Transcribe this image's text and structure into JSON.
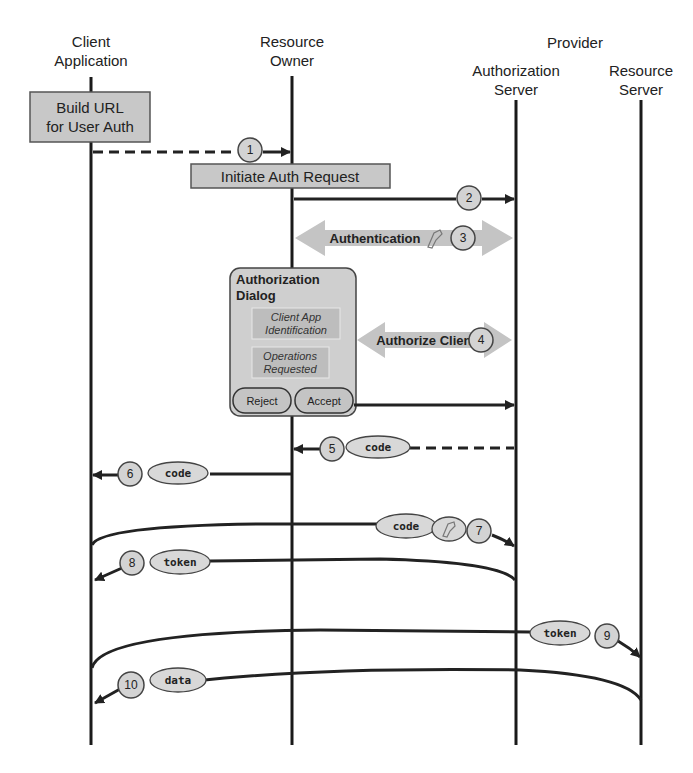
{
  "diagram": {
    "type": "sequence",
    "group_label": "Provider",
    "participants": [
      {
        "id": "client",
        "line1": "Client",
        "line2": "Application"
      },
      {
        "id": "owner",
        "line1": "Resource",
        "line2": "Owner"
      },
      {
        "id": "authserver",
        "line1": "Authorization",
        "line2": "Server"
      },
      {
        "id": "resserver",
        "line1": "Resource",
        "line2": "Server"
      }
    ],
    "activities": {
      "build_url": {
        "line1": "Build URL",
        "line2": "for User Auth"
      },
      "initiate": {
        "label": "Initiate Auth Request"
      }
    },
    "dialog": {
      "title1": "Authorization",
      "title2": "Dialog",
      "field1_line1": "Client App",
      "field1_line2": "Identification",
      "field2_line1": "Operations",
      "field2_line2": "Requested",
      "reject": "Reject",
      "accept": "Accept"
    },
    "steps": [
      {
        "n": "1",
        "from": "client",
        "to": "owner",
        "style": "dashed"
      },
      {
        "n": "2",
        "from": "owner",
        "to": "authserver",
        "style": "solid"
      },
      {
        "n": "3",
        "label": "Authentication",
        "style": "bidirectional",
        "icon": "key-icon"
      },
      {
        "n": "4",
        "label": "Authorize Client",
        "style": "bidirectional"
      },
      {
        "n": "5",
        "from": "authserver",
        "to": "owner",
        "style": "dashed",
        "payload": "code"
      },
      {
        "n": "6",
        "from": "owner",
        "to": "client",
        "style": "solid",
        "payload": "code"
      },
      {
        "n": "7",
        "from": "client",
        "to": "authserver",
        "style": "curved",
        "payload": "code",
        "icon": "key-icon"
      },
      {
        "n": "8",
        "from": "authserver",
        "to": "client",
        "style": "curved",
        "payload": "token"
      },
      {
        "n": "9",
        "from": "client",
        "to": "resserver",
        "style": "curved",
        "payload": "token"
      },
      {
        "n": "10",
        "from": "resserver",
        "to": "client",
        "style": "curved",
        "payload": "data"
      }
    ]
  }
}
